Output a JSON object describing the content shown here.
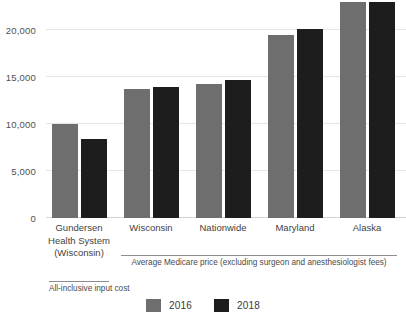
{
  "chart_data": {
    "type": "bar",
    "title": "",
    "subtitle": "",
    "xlabel": "",
    "ylabel": "",
    "ylim": [
      0,
      23500
    ],
    "yticks": [
      0,
      5000,
      10000,
      15000,
      20000
    ],
    "ytick_labels": [
      "0",
      "5,000",
      "10,000",
      "15,000",
      "20,000"
    ],
    "grid": true,
    "legend_position": "bottom-center",
    "categories": [
      "Gundersen Health System (Wisconsin)",
      "Wisconsin",
      "Nationwide",
      "Maryland",
      "Alaska"
    ],
    "category_lines": [
      [
        "Gundersen",
        "Health System",
        "(Wisconsin)"
      ],
      [
        "Wisconsin"
      ],
      [
        "Nationwide"
      ],
      [
        "Maryland"
      ],
      [
        "Alaska"
      ]
    ],
    "series": [
      {
        "name": "2016",
        "color": "#6e6e6e",
        "values": [
          10000,
          13700,
          14300,
          19500,
          23000
        ]
      },
      {
        "name": "2018",
        "color": "#1d1d1d",
        "values": [
          8400,
          13900,
          14700,
          20100,
          23000
        ]
      }
    ],
    "annotations": [
      {
        "text": "All-inclusive input cost",
        "spans_categories": [
          0
        ]
      },
      {
        "text": "Average Medicare price (excluding surgeon and anesthesiologist fees)",
        "spans_categories": [
          1,
          2,
          3,
          4
        ]
      }
    ]
  },
  "legend": {
    "items": [
      {
        "label": "2016",
        "color": "#6e6e6e"
      },
      {
        "label": "2018",
        "color": "#1d1d1d"
      }
    ]
  }
}
